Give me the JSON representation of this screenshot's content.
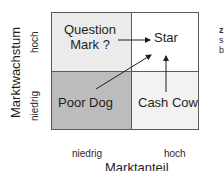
{
  "diagram": {
    "type": "bcg-portfolio-matrix",
    "quadrants": {
      "top_left": {
        "label_line1": "Question",
        "label_line2": "Mark ?",
        "fill": "#ebebeb"
      },
      "top_right": {
        "label": "Star",
        "fill": "#ffffff"
      },
      "bottom_left": {
        "label": "Poor Dog",
        "fill": "#bcbcbc"
      },
      "bottom_right": {
        "label": "Cash Cow",
        "fill": "#f2f2f2"
      }
    },
    "arrows": [
      {
        "from": "Question Mark ?",
        "to": "Star"
      },
      {
        "from": "Poor Dog",
        "to": "Star"
      },
      {
        "from": "Cash Cow",
        "to": "Star"
      }
    ],
    "y_axis": {
      "title": "Marktwachstum",
      "high": "hoch",
      "low": "niedrig"
    },
    "x_axis": {
      "title": "Marktanteil",
      "low": "niedrig",
      "high": "hoch"
    },
    "edge_fragments": [
      "z",
      "s",
      "b"
    ],
    "colors": {
      "border": "#5a5a5a",
      "text": "#1e1e1e",
      "arrow": "#1e1e1e"
    }
  }
}
